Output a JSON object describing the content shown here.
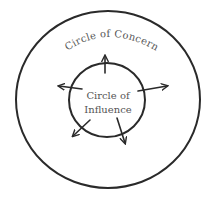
{
  "diagram": {
    "outer_circle": {
      "label": "Circle of Concern",
      "cx": 108,
      "cy": 99.5,
      "rx": 92,
      "ry": 88.5,
      "stroke": "#2a2a2a"
    },
    "inner_circle": {
      "label_line1": "Circle of",
      "label_line2": "Influence",
      "cx": 107,
      "cy": 100,
      "rx": 38,
      "ry": 37,
      "stroke": "#2a2a2a"
    },
    "arrows": [
      {
        "name": "arrow-up",
        "direction": "up"
      },
      {
        "name": "arrow-left",
        "direction": "left"
      },
      {
        "name": "arrow-right",
        "direction": "right"
      },
      {
        "name": "arrow-down-left",
        "direction": "down-left"
      },
      {
        "name": "arrow-down-right",
        "direction": "down-right"
      }
    ],
    "colors": {
      "background": "#ffffff",
      "ink": "#2a2a2a",
      "text": "#555555"
    }
  }
}
